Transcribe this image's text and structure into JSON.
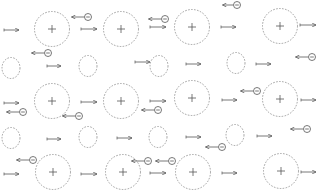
{
  "diagram": {
    "title": "",
    "colors": {
      "stroke": "#555555",
      "dashed": "#8a8a8a",
      "background": "#ffffff"
    },
    "ions": [
      {
        "x": 52,
        "y": 29
      },
      {
        "x": 121,
        "y": 29
      },
      {
        "x": 192,
        "y": 27
      },
      {
        "x": 280,
        "y": 26
      },
      {
        "x": 52,
        "y": 101
      },
      {
        "x": 121,
        "y": 101
      },
      {
        "x": 192,
        "y": 98
      },
      {
        "x": 280,
        "y": 99
      },
      {
        "x": 53,
        "y": 172
      },
      {
        "x": 123,
        "y": 172
      },
      {
        "x": 193,
        "y": 172
      },
      {
        "x": 281,
        "y": 171
      }
    ],
    "vacancies": [
      {
        "x": 11,
        "y": 68
      },
      {
        "x": 88,
        "y": 66
      },
      {
        "x": 159,
        "y": 66
      },
      {
        "x": 236,
        "y": 63
      },
      {
        "x": 11,
        "y": 138
      },
      {
        "x": 88,
        "y": 137
      },
      {
        "x": 158,
        "y": 137
      },
      {
        "x": 235,
        "y": 135
      }
    ],
    "right_arrows": [
      {
        "x1": 4,
        "x2": 19,
        "y": 30
      },
      {
        "x1": 81,
        "x2": 97,
        "y": 29
      },
      {
        "x1": 150,
        "x2": 166,
        "y": 27
      },
      {
        "x1": 221,
        "x2": 236,
        "y": 27
      },
      {
        "x1": 300,
        "x2": 316,
        "y": 25
      },
      {
        "x1": 47,
        "x2": 61,
        "y": 66
      },
      {
        "x1": 135,
        "x2": 150,
        "y": 62
      },
      {
        "x1": 186,
        "x2": 201,
        "y": 64
      },
      {
        "x1": 256,
        "x2": 271,
        "y": 64
      },
      {
        "x1": 4,
        "x2": 19,
        "y": 103
      },
      {
        "x1": 81,
        "x2": 97,
        "y": 102
      },
      {
        "x1": 150,
        "x2": 166,
        "y": 101
      },
      {
        "x1": 222,
        "x2": 237,
        "y": 100
      },
      {
        "x1": 301,
        "x2": 316,
        "y": 100
      },
      {
        "x1": 47,
        "x2": 61,
        "y": 139
      },
      {
        "x1": 117,
        "x2": 132,
        "y": 138
      },
      {
        "x1": 186,
        "x2": 201,
        "y": 137
      },
      {
        "x1": 257,
        "x2": 272,
        "y": 136
      },
      {
        "x1": 4,
        "x2": 19,
        "y": 174
      },
      {
        "x1": 81,
        "x2": 97,
        "y": 174
      },
      {
        "x1": 150,
        "x2": 166,
        "y": 173
      },
      {
        "x1": 222,
        "x2": 237,
        "y": 173
      },
      {
        "x1": 301,
        "x2": 316,
        "y": 172
      }
    ],
    "electrons": [
      {
        "x": 88,
        "y": 17,
        "tail": 13
      },
      {
        "x": 165,
        "y": 19,
        "tail": 13
      },
      {
        "x": 237,
        "y": 5,
        "tail": 11
      },
      {
        "x": 48,
        "y": 53,
        "tail": 13
      },
      {
        "x": 312,
        "y": 57,
        "tail": 13
      },
      {
        "x": 23,
        "y": 112,
        "tail": 13
      },
      {
        "x": 79,
        "y": 116,
        "tail": 13
      },
      {
        "x": 158,
        "y": 110,
        "tail": 13
      },
      {
        "x": 257,
        "y": 91,
        "tail": 13
      },
      {
        "x": 222,
        "y": 147,
        "tail": 13
      },
      {
        "x": 307,
        "y": 129,
        "tail": 13
      },
      {
        "x": 33,
        "y": 160,
        "tail": 13
      },
      {
        "x": 148,
        "y": 161,
        "tail": 13
      },
      {
        "x": 172,
        "y": 161,
        "tail": 13
      }
    ]
  }
}
